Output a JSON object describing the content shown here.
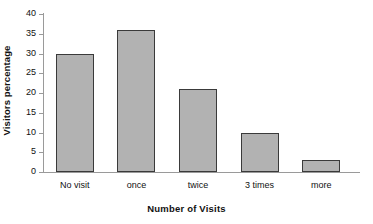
{
  "chart_data": {
    "type": "bar",
    "title": "",
    "xlabel": "Number of Visits",
    "ylabel": "Visitors percentage",
    "categories": [
      "No visit",
      "once",
      "twice",
      "3 times",
      "more"
    ],
    "values": [
      30,
      36,
      21,
      10,
      3
    ],
    "ylim": [
      0,
      40
    ],
    "yticks": [
      0,
      5,
      10,
      15,
      20,
      25,
      30,
      35,
      40
    ],
    "ytick_labels": [
      "0",
      "5",
      "10",
      "15",
      "20",
      "25",
      "30",
      "35",
      "40"
    ],
    "grid": false,
    "legend": null,
    "legend_position": "none",
    "bar_fill_color": "#b2b2b2",
    "bar_border_color": "#3a3a3a",
    "axis_color": "#9a9a9a",
    "background_color": "#ffffff",
    "text_color": "#111111"
  }
}
